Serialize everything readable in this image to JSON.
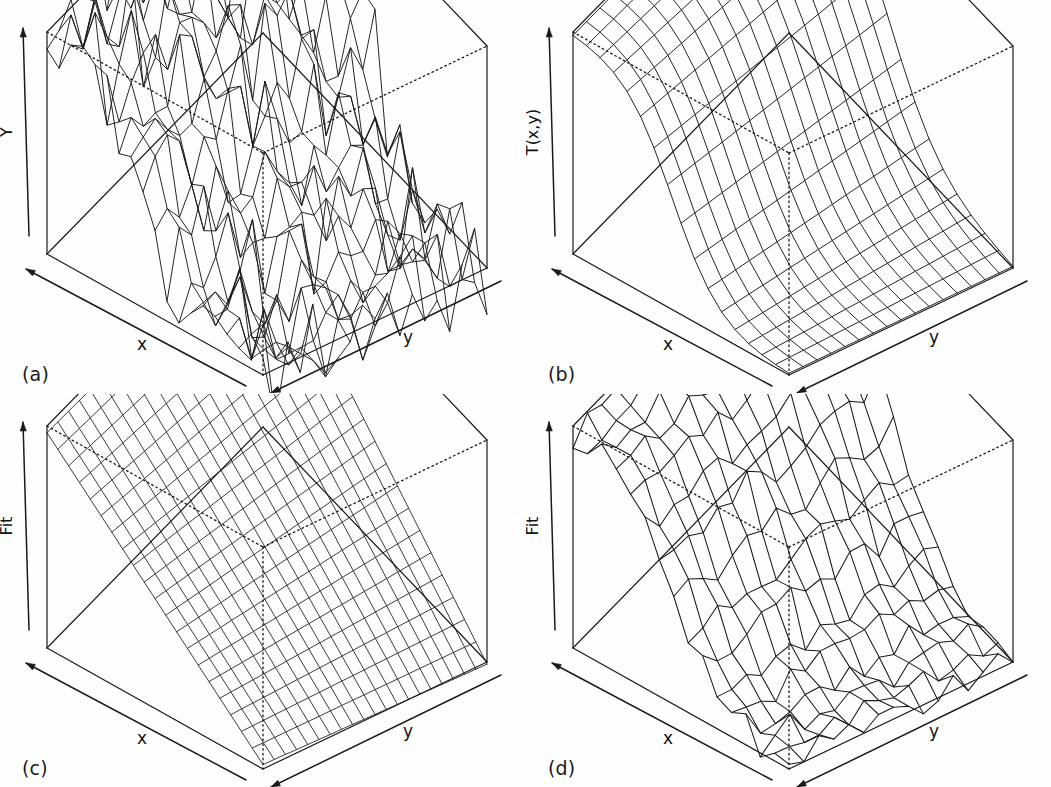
{
  "figure": {
    "background": "#fefefe",
    "ink": "#1a1a1a",
    "panel_count": 4,
    "layout": "2x2"
  },
  "panels": [
    {
      "tag": "(a)",
      "zlabel": "Y",
      "xlabel": "x",
      "ylabel": "y",
      "surface": "noisy-data"
    },
    {
      "tag": "(b)",
      "zlabel": "T(x,y)",
      "xlabel": "x",
      "ylabel": "y",
      "surface": "true-function"
    },
    {
      "tag": "(c)",
      "zlabel": "Fit",
      "xlabel": "x",
      "ylabel": "y",
      "surface": "linear-fit-plane"
    },
    {
      "tag": "(d)",
      "zlabel": "Fit",
      "xlabel": "x",
      "ylabel": "y",
      "surface": "smoothed-fit"
    }
  ],
  "chart_data": [
    {
      "type": "surface",
      "panel": "(a)",
      "title": "",
      "zlabel": "Y",
      "xlabel": "x",
      "ylabel": "y",
      "grid": 18,
      "grid_on": false,
      "legend": "none",
      "description": "Noisy observed response surface: sigmoid ridge in x plus large random noise",
      "zlim": [
        -0.45,
        1.45
      ],
      "surface_model": {
        "base": "sigmoid_ridge",
        "center": 0.46,
        "steepness": 9.0,
        "noise_amplitude": 0.3,
        "seed": 7
      }
    },
    {
      "type": "surface",
      "panel": "(b)",
      "title": "",
      "zlabel": "T(x,y)",
      "xlabel": "x",
      "ylabel": "y",
      "grid": 16,
      "grid_on": false,
      "legend": "none",
      "description": "True underlying function: smooth monotone sigmoid step along x, constant in y",
      "zlim": [
        0,
        1
      ],
      "surface_model": {
        "base": "sigmoid_ridge",
        "center": 0.46,
        "steepness": 9.0,
        "noise_amplitude": 0.0,
        "seed": 0
      }
    },
    {
      "type": "surface",
      "panel": "(c)",
      "title": "",
      "zlabel": "Fit",
      "xlabel": "x",
      "ylabel": "y",
      "grid": 20,
      "grid_on": false,
      "legend": "none",
      "description": "Linear least-squares fit: flat tilted plane descending along x",
      "zlim": [
        0,
        1
      ],
      "surface_model": {
        "base": "plane",
        "intercept": 0.97,
        "slope_x": -0.95,
        "slope_y": -0.03,
        "noise_amplitude": 0.0,
        "seed": 0
      }
    },
    {
      "type": "surface",
      "panel": "(d)",
      "title": "",
      "zlabel": "Fit",
      "xlabel": "x",
      "ylabel": "y",
      "grid": 15,
      "grid_on": false,
      "legend": "none",
      "description": "Nonparametric smoothed fit: sigmoid step recovered with small residual ripples",
      "zlim": [
        -0.1,
        1.2
      ],
      "surface_model": {
        "base": "sigmoid_ridge",
        "center": 0.46,
        "steepness": 8.0,
        "noise_amplitude": 0.085,
        "seed": 3
      }
    }
  ]
}
